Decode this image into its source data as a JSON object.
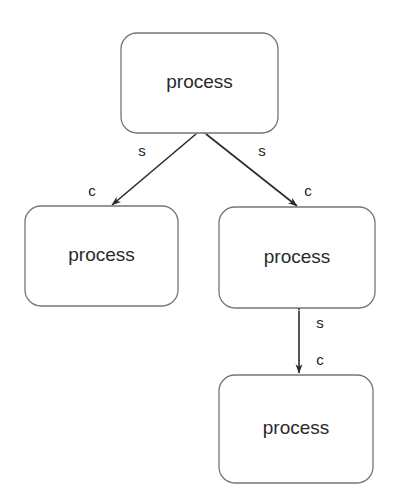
{
  "diagram": {
    "type": "node-edge-graph",
    "background_color": "#ffffff",
    "node_border_color": "#73767a",
    "node_fill_color": "#ffffff",
    "edge_color": "#2b2b2b",
    "label_color": "#2a2a2a",
    "cropped_header_text": "",
    "nodes": [
      {
        "id": "process-top",
        "label": "process",
        "x": 121,
        "y": 33,
        "width": 157,
        "height": 100,
        "corner_radius": 16
      },
      {
        "id": "process-left",
        "label": "process",
        "x": 25,
        "y": 206,
        "width": 153,
        "height": 100,
        "corner_radius": 16
      },
      {
        "id": "process-right",
        "label": "process",
        "x": 219,
        "y": 207,
        "width": 156,
        "height": 101,
        "corner_radius": 16
      },
      {
        "id": "process-bottom",
        "label": "process",
        "x": 219,
        "y": 375,
        "width": 154,
        "height": 108,
        "corner_radius": 16
      }
    ],
    "edges": [
      {
        "id": "edge-top-left",
        "from": "process-top",
        "to": "process-left",
        "bidirectional": true,
        "x1": 196,
        "y1": 134,
        "x2": 112,
        "y2": 205,
        "labels": [
          {
            "text": "s",
            "x": 142,
            "y": 152
          },
          {
            "text": "c",
            "x": 92,
            "y": 192
          }
        ]
      },
      {
        "id": "edge-top-right",
        "from": "process-top",
        "to": "process-right",
        "bidirectional": true,
        "x1": 206,
        "y1": 134,
        "x2": 297,
        "y2": 206,
        "labels": [
          {
            "text": "s",
            "x": 262,
            "y": 152
          },
          {
            "text": "c",
            "x": 308,
            "y": 192
          }
        ]
      },
      {
        "id": "edge-right-bottom",
        "from": "process-right",
        "to": "process-bottom",
        "bidirectional": true,
        "x1": 299,
        "y1": 311,
        "x2": 299,
        "y2": 373,
        "labels": [
          {
            "text": "s",
            "x": 320,
            "y": 324
          },
          {
            "text": "c",
            "x": 320,
            "y": 361
          }
        ]
      }
    ]
  }
}
